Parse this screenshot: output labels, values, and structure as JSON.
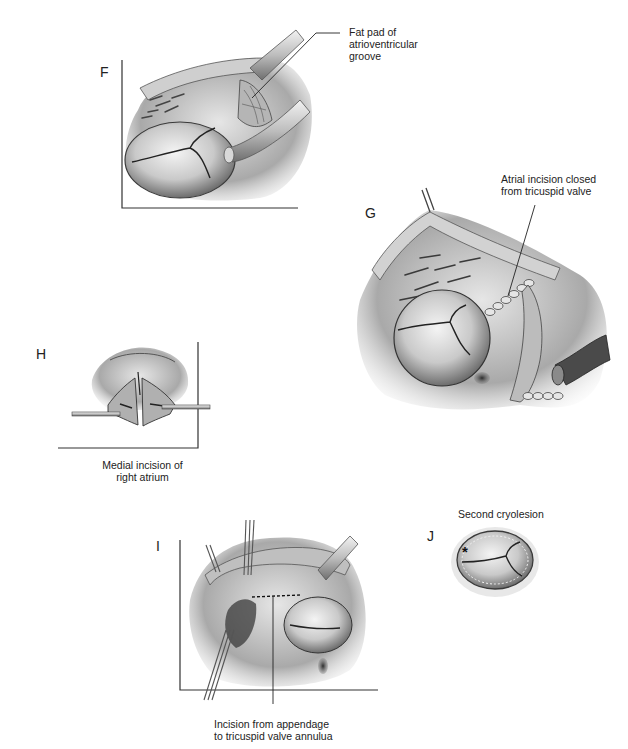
{
  "figure": {
    "panels": [
      {
        "id": "F",
        "letter": "F",
        "label": "Fat pad of\natrioventricular\ngroove"
      },
      {
        "id": "G",
        "letter": "G",
        "label": "Atrial incision closed\nfrom tricuspid valve"
      },
      {
        "id": "H",
        "letter": "H",
        "caption": "Medial incision of\nright atrium"
      },
      {
        "id": "I",
        "letter": "I",
        "caption": "Incision from appendage\nto tricuspid valve annulua"
      },
      {
        "id": "J",
        "letter": "J",
        "caption": "Second cryolesion",
        "marker": "*"
      }
    ],
    "labels": {
      "f_line1": "Fat pad of",
      "f_line2": "atrioventricular",
      "f_line3": "groove",
      "g_line1": "Atrial incision closed",
      "g_line2": "from tricuspid valve",
      "h_line1": "Medial incision of",
      "h_line2": "right atrium",
      "i_line1": "Incision from appendage",
      "i_line2": "to tricuspid valve annulua",
      "j_line1": "Second cryolesion",
      "j_marker": "*"
    },
    "colors": {
      "ink": "#1a1a1a",
      "tissue_light": "#e8e8e8",
      "tissue_mid": "#a8a8a8",
      "tissue_dark": "#3a3a3a",
      "background": "#ffffff"
    }
  }
}
